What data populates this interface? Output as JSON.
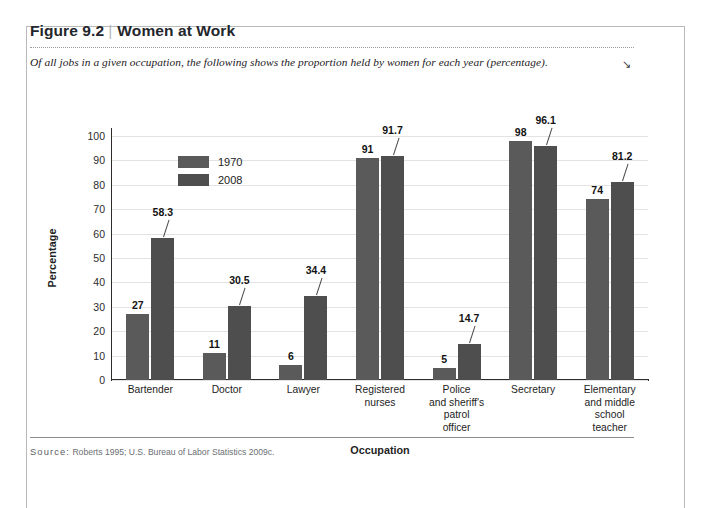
{
  "figure": {
    "number": "Figure 9.2",
    "separator": "|",
    "title": "Women at Work",
    "subtitle": "Of all jobs in a given occupation, the following shows the proportion held by women for each year (percentage).",
    "corner_mark": "↘",
    "source_word": "Source:",
    "source_text": "Roberts 1995; U.S. Bureau of Labor Statistics 2009c."
  },
  "chart_data": {
    "type": "bar",
    "title": "Women at Work",
    "xlabel": "Occupation",
    "ylabel": "Percentage",
    "ylim": [
      0,
      100
    ],
    "yticks": [
      0,
      10,
      20,
      30,
      40,
      50,
      60,
      70,
      80,
      90,
      100
    ],
    "grid": true,
    "legend_position": "inside-top-left",
    "categories": [
      "Bartender",
      "Doctor",
      "Lawyer",
      "Registered nurses",
      "Police and sheriff's patrol officer",
      "Secretary",
      "Elementary and middle school teacher"
    ],
    "category_lines": [
      [
        "Bartender"
      ],
      [
        "Doctor"
      ],
      [
        "Lawyer"
      ],
      [
        "Registered",
        "nurses"
      ],
      [
        "Police",
        "and sheriff's",
        "patrol",
        "officer"
      ],
      [
        "Secretary"
      ],
      [
        "Elementary",
        "and middle",
        "school",
        "teacher"
      ]
    ],
    "series": [
      {
        "name": "1970",
        "color": "#5a5a5a",
        "values": [
          27,
          11,
          6,
          91,
          5,
          98,
          74
        ],
        "labels": [
          "27",
          "11",
          "6",
          "91",
          "5",
          "98",
          "74"
        ]
      },
      {
        "name": "2008",
        "color": "#4e4e4e",
        "values": [
          58.3,
          30.5,
          34.4,
          91.7,
          14.7,
          96.1,
          81.2
        ],
        "labels": [
          "58.3",
          "30.5",
          "34.4",
          "91.7",
          "14.7",
          "96.1",
          "81.2"
        ]
      }
    ]
  }
}
